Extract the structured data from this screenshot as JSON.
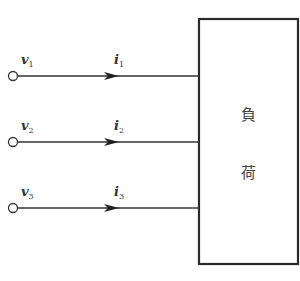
{
  "diagram": {
    "type": "three-terminal load circuit",
    "terminals": [
      {
        "voltage_symbol": "v",
        "voltage_sub": "1",
        "current_symbol": "i",
        "current_sub": "1"
      },
      {
        "voltage_symbol": "v",
        "voltage_sub": "2",
        "current_symbol": "i",
        "current_sub": "2"
      },
      {
        "voltage_symbol": "v",
        "voltage_sub": "3",
        "current_symbol": "i",
        "current_sub": "3"
      }
    ],
    "load": {
      "label_line1": "負",
      "label_line2": "荷"
    }
  }
}
